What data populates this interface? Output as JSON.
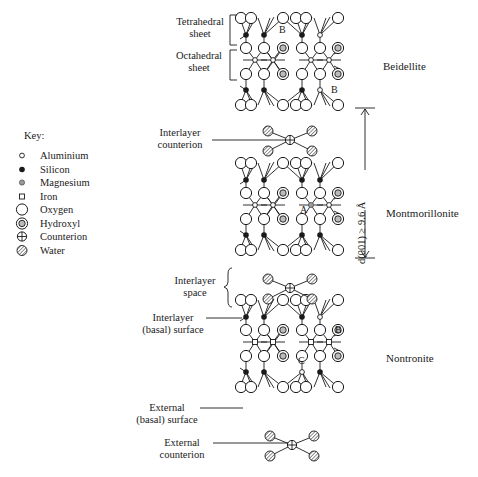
{
  "key": {
    "title": "Key:",
    "items": [
      {
        "symbol": "aluminium",
        "label": "Aluminium"
      },
      {
        "symbol": "silicon",
        "label": "Silicon"
      },
      {
        "symbol": "magnesium",
        "label": "Magnesium"
      },
      {
        "symbol": "iron",
        "label": "Iron"
      },
      {
        "symbol": "oxygen",
        "label": "Oxygen"
      },
      {
        "symbol": "hydroxyl",
        "label": "Hydroxyl"
      },
      {
        "symbol": "counterion",
        "label": "Counterion"
      },
      {
        "symbol": "water",
        "label": "Water"
      }
    ]
  },
  "labels": {
    "tetrahedral_sheet": [
      "Tetrahedral",
      "sheet"
    ],
    "octahedral_sheet": [
      "Octahedral",
      "sheet"
    ],
    "interlayer_counterion": [
      "Interlayer",
      "counterion"
    ],
    "interlayer_space": [
      "Interlayer",
      "space"
    ],
    "interlayer_surface": [
      "Interlayer",
      "(basal) surface"
    ],
    "external_surface": [
      "External",
      "(basal) surface"
    ],
    "external_counterion": [
      "External",
      "counterion"
    ]
  },
  "minerals": {
    "beidellite": "Beidellite",
    "montmorillonite": "Montmorillonite",
    "nontronite": "Nontronite"
  },
  "d_spacing": {
    "label": "d(001) ≥ 9.6 Å"
  },
  "atom_tags": {
    "A": "A",
    "B": "B",
    "C": "C"
  },
  "layers": [
    {
      "name": "beidellite",
      "top": 18,
      "tet_top_subst": [
        3
      ],
      "tet_bot_subst": [
        3
      ],
      "oct_subst": [],
      "tet_bot_mg": []
    },
    {
      "name": "montmorillonite",
      "top": 163,
      "tet_top_subst": [],
      "tet_bot_subst": [],
      "oct_subst": [
        2
      ],
      "tet_bot_mg": []
    },
    {
      "name": "nontronite",
      "top": 300,
      "tet_top_subst": [
        3
      ],
      "tet_bot_subst": [
        2
      ],
      "oct_subst": [],
      "tet_bot_mg": [],
      "iron": true
    }
  ],
  "counterions": [
    {
      "name": "interlayer-counterion",
      "cx": 290,
      "cy": 140
    },
    {
      "name": "interlayer-space-counterion",
      "cx": 290,
      "cy": 288
    },
    {
      "name": "external-counterion",
      "cx": 292,
      "cy": 445
    }
  ],
  "colors": {
    "line": "#1a1a1a",
    "water_fill": "#9a9a9a",
    "background": "#ffffff"
  }
}
